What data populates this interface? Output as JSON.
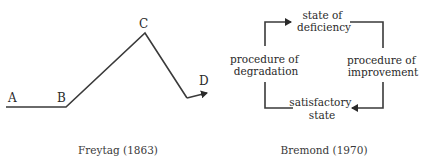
{
  "freytag": {
    "points": {
      "A": "A",
      "B": "B",
      "C": "C",
      "D": "D"
    },
    "caption": "Freytag (1863)"
  },
  "bremond": {
    "top": [
      "state of",
      "deficiency"
    ],
    "right": [
      "procedure of",
      "improvement"
    ],
    "bottom": [
      "satisfactory",
      "state"
    ],
    "left": [
      "procedure of",
      "degradation"
    ],
    "caption": "Bremond (1970)"
  },
  "colors": {
    "line": "#3a3a3a",
    "text": "#2a2a2a",
    "background": "#ffffff"
  }
}
